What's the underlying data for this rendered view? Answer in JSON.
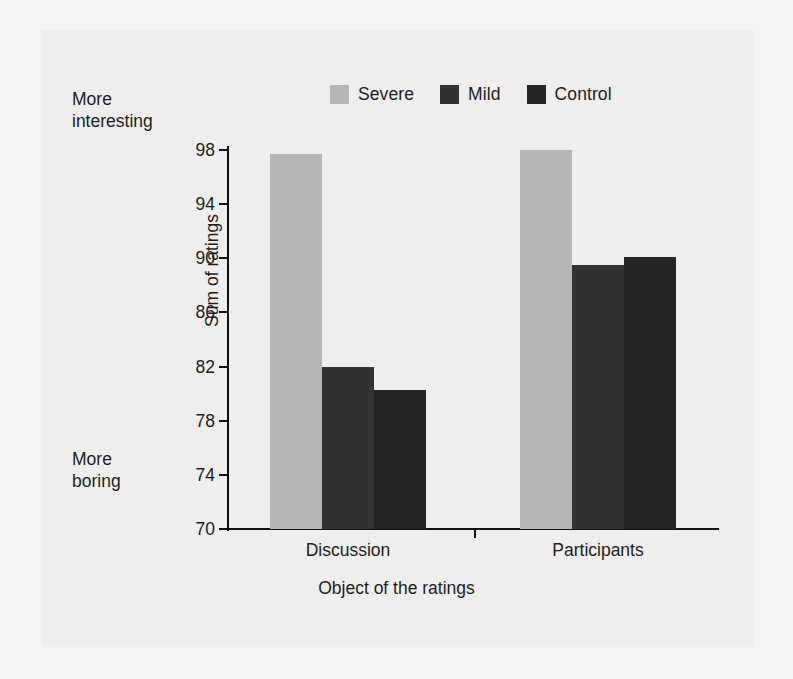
{
  "chart_data": {
    "type": "bar",
    "title": "",
    "subtitle": "",
    "categories": [
      "Discussion",
      "Participants"
    ],
    "series": [
      {
        "name": "Severe",
        "values": [
          97.7,
          98.0
        ],
        "color": "#b6b6b6"
      },
      {
        "name": "Mild",
        "values": [
          82.0,
          89.5
        ],
        "color": "#333333"
      },
      {
        "name": "Control",
        "values": [
          80.3,
          90.1
        ],
        "color": "#242424"
      }
    ],
    "xlabel": "Object of the ratings",
    "ylabel": "Sum of ratings",
    "ylim": [
      70,
      98
    ],
    "yticks": [
      70,
      74,
      78,
      82,
      86,
      90,
      94,
      98
    ],
    "ytick_labels": [
      "70",
      "74",
      "78",
      "82",
      "86",
      "90",
      "94",
      "98"
    ],
    "grid": false,
    "legend_position": "top-center",
    "annotations": [
      {
        "text": "More\ninteresting",
        "position": "top-left-outside"
      },
      {
        "text": "More\nboring",
        "position": "bottom-left-outside"
      }
    ]
  },
  "legend": {
    "entries": [
      {
        "label": "Severe",
        "color": "#b6b6b6"
      },
      {
        "label": "Mild",
        "color": "#333333"
      },
      {
        "label": "Control",
        "color": "#242424"
      }
    ]
  },
  "axes": {
    "y_title": "Sum of ratings",
    "x_title": "Object of the ratings",
    "y_tick_labels": [
      "98",
      "94",
      "90",
      "86",
      "82",
      "78",
      "74",
      "70"
    ],
    "x_group_labels": [
      "Discussion",
      "Participants"
    ]
  },
  "annotations": {
    "top_note": "More\ninteresting",
    "bottom_note": "More\nboring"
  },
  "colors": {
    "background": "#efeeed",
    "page": "#f4f3f2",
    "axis": "#111111",
    "text": "#1d1d1d",
    "severe": "#b6b6b6",
    "mild": "#333333",
    "control": "#242424"
  }
}
